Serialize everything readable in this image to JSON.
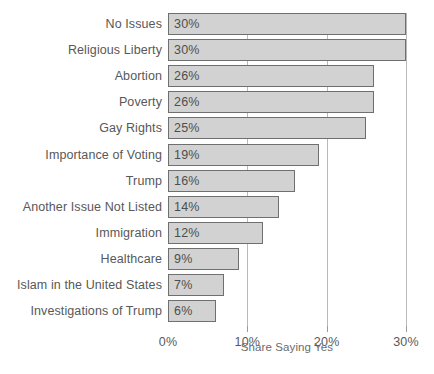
{
  "chart_data": {
    "type": "bar",
    "orientation": "horizontal",
    "title": "",
    "xlabel": "Share Saying Yes",
    "ylabel": "",
    "xlim": [
      0,
      30
    ],
    "grid": true,
    "legend": null,
    "xticks": [
      "0%",
      "10%",
      "20%",
      "30%"
    ],
    "xtick_values": [
      0,
      10,
      20,
      30
    ],
    "categories": [
      "No Issues",
      "Religious Liberty",
      "Abortion",
      "Poverty",
      "Gay Rights",
      "Importance of Voting",
      "Trump",
      "Another Issue Not Listed",
      "Immigration",
      "Healthcare",
      "Islam in the United States",
      "Investigations of Trump"
    ],
    "values": [
      30,
      30,
      26,
      26,
      25,
      19,
      16,
      14,
      12,
      9,
      7,
      6
    ],
    "data_labels": [
      "30%",
      "30%",
      "26%",
      "26%",
      "25%",
      "19%",
      "16%",
      "14%",
      "12%",
      "9%",
      "7%",
      "6%"
    ],
    "colors": {
      "bar_fill": "#d2d2d2",
      "bar_border": "#6f6f6f",
      "gridline": "#b9b9b9",
      "text": "#585858",
      "background": "#ffffff"
    }
  }
}
